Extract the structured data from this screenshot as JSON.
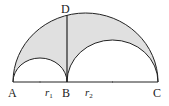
{
  "diagram": {
    "type": "arbelos",
    "colors": {
      "fill": "#e0e0e0",
      "stroke": "#222222",
      "background": "#ffffff"
    },
    "points": {
      "A": {
        "label": "A",
        "x": 13,
        "y": 82
      },
      "B": {
        "label": "B",
        "x": 67,
        "y": 82
      },
      "C": {
        "label": "C",
        "x": 158,
        "y": 82
      },
      "D": {
        "label": "D",
        "x": 67,
        "y": 14
      }
    },
    "segments": {
      "r1": {
        "label": "r",
        "sub": "1"
      },
      "r2": {
        "label": "r",
        "sub": "2"
      }
    },
    "arcs": {
      "large": {
        "from": "A",
        "to": "C"
      },
      "small": {
        "from": "A",
        "to": "B"
      },
      "medium": {
        "from": "B",
        "to": "C"
      }
    }
  }
}
